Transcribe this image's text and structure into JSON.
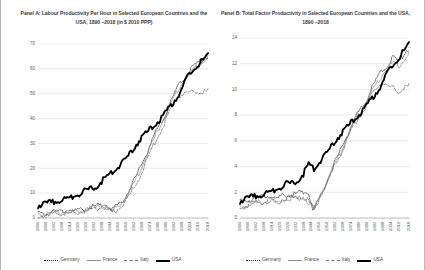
{
  "figure": {
    "background": "#ffffff",
    "border_color": "#b9b9b9"
  },
  "legend": {
    "position": "bottom-center",
    "items": [
      {
        "label": "Germany",
        "style": "dotted",
        "color": "#2b2b2b",
        "icon": "line-dotted-icon"
      },
      {
        "label": "France",
        "style": "solid-thin",
        "color": "#8e8e8e",
        "icon": "line-solid-icon"
      },
      {
        "label": "Italy",
        "style": "dashed",
        "color": "#6f6f6f",
        "icon": "line-dashed-icon"
      },
      {
        "label": "USA",
        "style": "solid-thick",
        "color": "#000000",
        "icon": "line-bold-icon"
      }
    ]
  },
  "chart_data": [
    {
      "id": "panel-a",
      "type": "line",
      "title": "Panel A: Labour Productivity Per Hour in Selected European Countries and the USA, 1890  –2018  (in $ 2010 PPP)",
      "xlabel": "",
      "ylabel": "",
      "ylim": [
        0,
        70
      ],
      "yticks": [
        0,
        10,
        20,
        30,
        40,
        50,
        60,
        70
      ],
      "grid": true,
      "xlim": [
        1890,
        2018
      ],
      "xticks": [
        1890,
        1896,
        1902,
        1908,
        1914,
        1920,
        1926,
        1932,
        1938,
        1944,
        1950,
        1956,
        1962,
        1968,
        1974,
        1980,
        1986,
        1992,
        1998,
        2004,
        2010,
        2018
      ],
      "x": [
        1890,
        1894,
        1898,
        1902,
        1906,
        1910,
        1914,
        1918,
        1922,
        1926,
        1930,
        1934,
        1938,
        1942,
        1946,
        1950,
        1954,
        1958,
        1962,
        1966,
        1970,
        1974,
        1978,
        1982,
        1986,
        1990,
        1994,
        1998,
        2002,
        2006,
        2010,
        2014,
        2018
      ],
      "series": [
        {
          "name": "Germany",
          "values": [
            2.1,
            2.4,
            2.7,
            3.0,
            3.3,
            3.7,
            3.8,
            3.2,
            3.8,
            4.6,
            5.1,
            5.4,
            6.4,
            6.2,
            4.0,
            5.6,
            8.0,
            11.2,
            15.4,
            19.6,
            24.6,
            29.4,
            34.2,
            38.0,
            42.5,
            47.0,
            52.0,
            55.5,
            58.0,
            61.0,
            62.5,
            64.5,
            66.0
          ]
        },
        {
          "name": "France",
          "values": [
            1.9,
            2.1,
            2.4,
            2.6,
            2.9,
            3.2,
            3.4,
            2.9,
            3.6,
            4.3,
            4.8,
            4.9,
            5.6,
            4.6,
            3.4,
            5.2,
            7.4,
            10.2,
            14.4,
            18.8,
            23.8,
            28.6,
            33.4,
            37.6,
            42.0,
            46.2,
            50.8,
            54.2,
            57.2,
            59.8,
            61.5,
            63.5,
            65.2
          ]
        },
        {
          "name": "Italy",
          "values": [
            1.6,
            1.8,
            2.0,
            2.3,
            2.6,
            2.9,
            3.1,
            2.7,
            3.3,
            3.8,
            4.2,
            4.4,
            5.0,
            4.2,
            2.6,
            4.2,
            6.2,
            8.6,
            12.6,
            16.8,
            21.6,
            26.4,
            31.2,
            35.4,
            40.0,
            44.0,
            48.6,
            50.6,
            51.2,
            51.0,
            51.4,
            51.0,
            51.8
          ]
        },
        {
          "name": "USA",
          "values": [
            5.6,
            6.2,
            6.6,
            7.2,
            7.8,
            8.2,
            8.8,
            10.0,
            10.6,
            11.8,
            12.2,
            13.4,
            15.4,
            17.4,
            19.4,
            21.2,
            23.4,
            25.6,
            28.6,
            31.6,
            34.2,
            36.0,
            38.4,
            40.0,
            43.2,
            45.6,
            48.8,
            52.4,
            56.6,
            60.0,
            62.4,
            64.0,
            66.4
          ]
        }
      ]
    },
    {
      "id": "panel-b",
      "type": "line",
      "title": "Panel B: Total Factor Productivity in Selected European Countries and the USA, 1890  –2018",
      "xlabel": "",
      "ylabel": "",
      "ylim": [
        0,
        14
      ],
      "yticks": [
        0,
        2,
        4,
        6,
        8,
        10,
        12,
        14
      ],
      "grid": true,
      "xlim": [
        1890,
        2018
      ],
      "xticks": [
        1890,
        1896,
        1902,
        1908,
        1914,
        1920,
        1926,
        1932,
        1938,
        1944,
        1950,
        1956,
        1962,
        1968,
        1974,
        1980,
        1986,
        1992,
        1998,
        2004,
        2010,
        2018
      ],
      "x": [
        1890,
        1894,
        1898,
        1902,
        1906,
        1910,
        1914,
        1918,
        1922,
        1926,
        1930,
        1934,
        1938,
        1942,
        1946,
        1950,
        1954,
        1958,
        1962,
        1966,
        1970,
        1974,
        1978,
        1982,
        1986,
        1990,
        1994,
        1998,
        2002,
        2006,
        2010,
        2014,
        2018
      ],
      "series": [
        {
          "name": "Germany",
          "values": [
            1.35,
            1.5,
            1.6,
            1.72,
            1.82,
            1.9,
            1.95,
            1.5,
            1.85,
            2.0,
            1.95,
            2.05,
            2.25,
            2.1,
            0.6,
            1.6,
            2.6,
            3.5,
            4.5,
            5.3,
            6.3,
            7.2,
            8.0,
            8.6,
            9.4,
            10.2,
            11.0,
            11.6,
            12.1,
            12.6,
            12.2,
            12.9,
            13.4
          ]
        },
        {
          "name": "France",
          "values": [
            0.95,
            1.05,
            1.15,
            1.25,
            1.35,
            1.42,
            1.5,
            1.2,
            1.55,
            1.7,
            1.62,
            1.6,
            1.7,
            1.3,
            0.85,
            1.7,
            2.6,
            3.4,
            4.4,
            5.2,
            6.2,
            7.1,
            7.9,
            8.5,
            9.2,
            10.0,
            10.6,
            11.3,
            11.8,
            12.2,
            11.9,
            12.4,
            12.9
          ]
        },
        {
          "name": "Italy",
          "values": [
            1.0,
            1.1,
            1.2,
            1.3,
            1.4,
            1.5,
            1.55,
            1.25,
            1.6,
            1.72,
            1.68,
            1.66,
            1.78,
            1.45,
            0.75,
            1.65,
            2.55,
            3.3,
            4.3,
            5.1,
            6.0,
            6.9,
            7.7,
            8.3,
            9.0,
            9.7,
            10.3,
            10.7,
            10.4,
            10.2,
            9.9,
            10.2,
            10.4
          ]
        },
        {
          "name": "USA",
          "values": [
            1.45,
            1.6,
            1.7,
            1.85,
            1.95,
            2.05,
            2.2,
            2.45,
            2.6,
            2.85,
            2.75,
            3.1,
            3.55,
            4.35,
            4.0,
            4.5,
            5.0,
            5.5,
            6.1,
            6.6,
            7.1,
            7.5,
            8.0,
            8.3,
            8.9,
            9.4,
            10.0,
            10.7,
            11.4,
            12.1,
            12.6,
            13.1,
            13.7
          ]
        }
      ]
    }
  ]
}
